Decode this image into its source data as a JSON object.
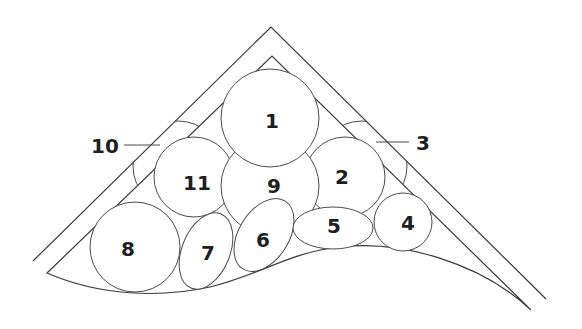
{
  "diagram": {
    "type": "numbered cross-section packing diagram",
    "outer_frame": {
      "apex": [
        271,
        27
      ],
      "left_end": [
        33,
        261
      ],
      "right_end": [
        546,
        299
      ]
    },
    "inner_frame": {
      "apex": [
        272,
        56
      ],
      "left_corner": [
        47,
        273
      ],
      "right_tip": [
        531,
        310
      ]
    },
    "labels": {
      "l1": "1",
      "l2": "2",
      "l3": "3",
      "l4": "4",
      "l5": "5",
      "l6": "6",
      "l7": "7",
      "l8": "8",
      "l9": "9",
      "l10": "10",
      "l11": "11"
    },
    "elements": [
      {
        "id": "1",
        "shape": "circle",
        "center": [
          270,
          118
        ],
        "radius": 49
      },
      {
        "id": "2",
        "shape": "circle",
        "center": [
          345,
          177
        ],
        "radius": 40
      },
      {
        "id": "3",
        "shape": "circle-partial",
        "leader_label": true
      },
      {
        "id": "4",
        "shape": "ellipse",
        "center": [
          403,
          222
        ],
        "rx": 29,
        "ry": 29
      },
      {
        "id": "5",
        "shape": "ellipse",
        "center": [
          333,
          228
        ],
        "rx": 40,
        "ry": 21
      },
      {
        "id": "6",
        "shape": "ellipse-rotated",
        "center": [
          264,
          235
        ]
      },
      {
        "id": "7",
        "shape": "ellipse-rotated",
        "center": [
          206,
          251
        ]
      },
      {
        "id": "8",
        "shape": "circle",
        "center": [
          135,
          247
        ],
        "radius": 45
      },
      {
        "id": "9",
        "shape": "circle",
        "center": [
          270,
          186
        ],
        "radius": 49
      },
      {
        "id": "10",
        "shape": "circle-partial",
        "leader_label": true
      },
      {
        "id": "11",
        "shape": "circle",
        "center": [
          194,
          177
        ],
        "radius": 40
      }
    ]
  }
}
